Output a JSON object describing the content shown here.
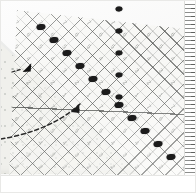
{
  "image": {
    "title": "Quilting ruler aligned on triangular fabric piece",
    "subject": "transparent-quilting-ruler-on-fabric",
    "background_color": "#ffffff"
  },
  "ruler": {
    "name": "transparent quilting ruler",
    "body_color": "#f6f6f3",
    "grid_line_color": "#464846",
    "diagonal_line_color": "#3c3e3c",
    "grid_numbers": [
      "7",
      "6",
      "5",
      "4",
      "3",
      "2",
      "1",
      "7",
      "6",
      "5",
      "4",
      "3",
      "2",
      "1",
      "7",
      "6",
      "6",
      "5",
      "4",
      "3",
      "2",
      "1",
      "7",
      "6",
      "5",
      "4",
      "3",
      "2",
      "1",
      "7",
      "6",
      "5",
      "5",
      "4",
      "3",
      "2",
      "1",
      "7",
      "6",
      "5",
      "4",
      "3",
      "2",
      "1",
      "7",
      "6",
      "5",
      "4",
      "4",
      "3",
      "2",
      "1",
      "7",
      "6",
      "5",
      "4",
      "3",
      "2",
      "1",
      "7",
      "6",
      "5",
      "4",
      "3",
      "3",
      "2",
      "1",
      "7",
      "6",
      "5",
      "4",
      "3",
      "2",
      "1",
      "7",
      "6",
      "5",
      "4",
      "3",
      "2",
      "2",
      "1",
      "7",
      "6",
      "5",
      "4",
      "3",
      "2",
      "1",
      "7",
      "6",
      "5",
      "4",
      "3",
      "2",
      "1",
      "1",
      "7",
      "6",
      "5",
      "4",
      "3",
      "2",
      "1",
      "7",
      "6",
      "5",
      "4",
      "3",
      "2",
      "1",
      "7",
      "7",
      "6",
      "5",
      "4",
      "3",
      "2",
      "1",
      "7",
      "6",
      "5",
      "4",
      "3",
      "2",
      "1",
      "7",
      "6",
      "6",
      "5",
      "4",
      "3",
      "2",
      "1",
      "7",
      "6",
      "5",
      "4",
      "3",
      "2",
      "1",
      "7",
      "6",
      "5",
      "5",
      "4",
      "3",
      "2",
      "1",
      "7",
      "6",
      "5",
      "4",
      "3",
      "2",
      "1",
      "7",
      "6",
      "5",
      "4",
      "4",
      "3",
      "2",
      "1",
      "7",
      "6",
      "5",
      "4",
      "3",
      "2",
      "1",
      "7",
      "6",
      "5",
      "4",
      "3",
      "3",
      "2",
      "1",
      "7",
      "6",
      "5",
      "4",
      "3",
      "2",
      "1",
      "7",
      "6",
      "5",
      "4",
      "3",
      "2",
      "2",
      "1",
      "7",
      "6",
      "5",
      "4",
      "3",
      "2",
      "1",
      "7",
      "6",
      "5",
      "4",
      "3",
      "2",
      "1",
      "1",
      "7",
      "6",
      "5",
      "4",
      "3",
      "2",
      "1",
      "7",
      "6",
      "5",
      "4",
      "3",
      "2",
      "1",
      "7",
      "7",
      "6",
      "5",
      "4",
      "3",
      "2",
      "1",
      "7",
      "6",
      "5",
      "4",
      "3",
      "2",
      "1",
      "7",
      "6"
    ]
  },
  "markers": {
    "name": "alignment marker dots",
    "color": "#1b1b1b",
    "count": 11,
    "positions": [
      {
        "x": 41,
        "y": 27
      },
      {
        "x": 54,
        "y": 40
      },
      {
        "x": 67,
        "y": 53
      },
      {
        "x": 80,
        "y": 66
      },
      {
        "x": 93,
        "y": 79
      },
      {
        "x": 106,
        "y": 92
      },
      {
        "x": 119,
        "y": 105
      },
      {
        "x": 132,
        "y": 118
      },
      {
        "x": 145,
        "y": 131
      },
      {
        "x": 158,
        "y": 144
      },
      {
        "x": 171,
        "y": 157
      }
    ]
  },
  "top_markers": {
    "name": "vertical column markers",
    "positions": [
      {
        "x": 119,
        "y": 9
      },
      {
        "x": 119,
        "y": 31
      },
      {
        "x": 119,
        "y": 53
      },
      {
        "x": 119,
        "y": 75
      },
      {
        "x": 119,
        "y": 97
      }
    ]
  },
  "fabric": {
    "name": "triangular fabric piece",
    "shape": "right triangle",
    "fill_color": "#f0f0ec",
    "speckle_color": "#9aa09a"
  },
  "annotations": {
    "curved_arrow": {
      "name": "fold-direction arrow",
      "style": "dashed",
      "color": "#2a2a2a",
      "description": "dashed curve sweeping up-right toward the ruler edge"
    },
    "small_arrow": {
      "name": "corner alignment arrow",
      "color": "#1b1b1b",
      "description": "small solid arrowhead at upper-left of fabric"
    }
  },
  "edge_scale": {
    "name": "right edge tick ruler",
    "tick_color": "#5a5c5a",
    "orientation": "vertical"
  }
}
